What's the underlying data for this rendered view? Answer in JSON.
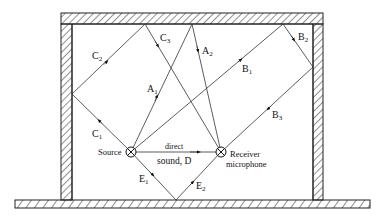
{
  "diagram": {
    "colors": {
      "line": "#222222",
      "background": "#ffffff"
    },
    "nodes": {
      "source": {
        "label": "Source",
        "x": 131,
        "y": 152
      },
      "receiver": {
        "label_line1": "Receiver",
        "label_line2": "microphone",
        "x": 221,
        "y": 152
      }
    },
    "direct": {
      "label_line1": "direct",
      "label_line2": "sound, D"
    },
    "ray_labels": {
      "A1": {
        "main": "A",
        "sub": "1"
      },
      "A2": {
        "main": "A",
        "sub": "2"
      },
      "B1": {
        "main": "B",
        "sub": "1"
      },
      "B2": {
        "main": "B",
        "sub": "2"
      },
      "B3": {
        "main": "B",
        "sub": "3"
      },
      "C1": {
        "main": "C",
        "sub": "1"
      },
      "C2": {
        "main": "C",
        "sub": "2"
      },
      "C3": {
        "main": "C",
        "sub": "3"
      },
      "E1": {
        "main": "E",
        "sub": "1"
      },
      "E2": {
        "main": "E",
        "sub": "2"
      }
    }
  }
}
